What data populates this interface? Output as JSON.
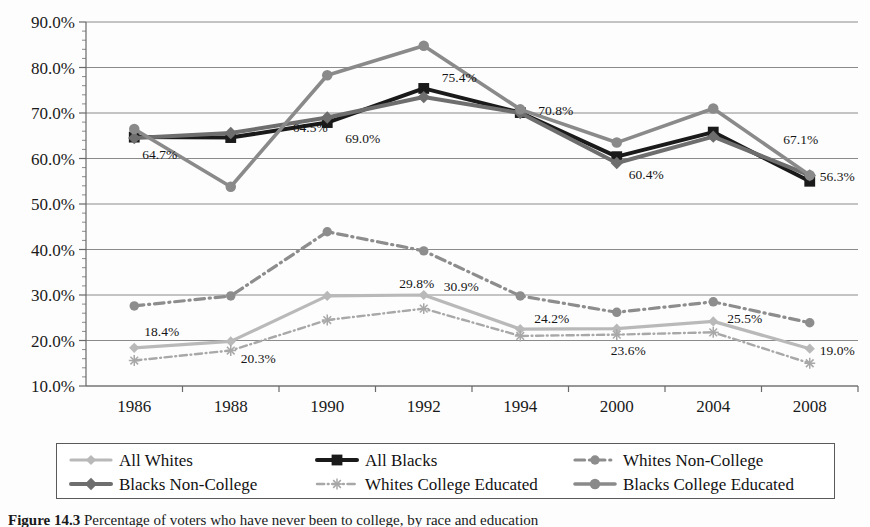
{
  "figure": {
    "caption_label": "Figure 14.3",
    "caption_text": "Percentage of voters who have never been to college, by race and education"
  },
  "legend": {
    "items": [
      {
        "label": "All Whites",
        "color": "#b9b9b9",
        "marker": "diamond",
        "dash": "solid",
        "width": 3.2
      },
      {
        "label": "All Blacks",
        "color": "#1a1a1a",
        "marker": "square",
        "dash": "solid",
        "width": 4.0
      },
      {
        "label": "Whites Non-College",
        "color": "#8d8d8d",
        "marker": "circle",
        "dash": "dashdot",
        "width": 3.2
      },
      {
        "label": "Blacks Non-College",
        "color": "#6e6e6e",
        "marker": "diamond",
        "dash": "solid",
        "width": 4.0
      },
      {
        "label": "Whites College Educated",
        "color": "#a8a8a8",
        "marker": "star",
        "dash": "dashdot",
        "width": 2.4
      },
      {
        "label": "Blacks College Educated",
        "color": "#8a8a8a",
        "marker": "circle",
        "dash": "solid",
        "width": 3.6
      }
    ]
  },
  "chart_data": {
    "type": "line",
    "title": "",
    "xlabel": "",
    "ylabel": "",
    "categories": [
      "1986",
      "1988",
      "1990",
      "1992",
      "1994",
      "2000",
      "2004",
      "2008"
    ],
    "ylim": [
      10,
      90
    ],
    "ytick_labels": [
      "10.0%",
      "20.0%",
      "30.0%",
      "40.0%",
      "50.0%",
      "60.0%",
      "70.0%",
      "80.0%",
      "90.0%"
    ],
    "ytick_values": [
      10,
      20,
      30,
      40,
      50,
      60,
      70,
      80,
      90
    ],
    "minor_tick_step": 2,
    "grid": "horizontal",
    "legend_position": "bottom",
    "series": [
      {
        "name": "All Whites",
        "color": "#b9b9b9",
        "marker": "diamond",
        "dash": "solid",
        "width": 3.2,
        "values": [
          18.4,
          19.8,
          29.8,
          30.0,
          22.5,
          22.6,
          24.2,
          18.2
        ]
      },
      {
        "name": "All Blacks",
        "color": "#1a1a1a",
        "marker": "square",
        "dash": "solid",
        "width": 4.0,
        "values": [
          64.7,
          64.6,
          67.9,
          75.4,
          70.1,
          60.4,
          65.8,
          55.0
        ]
      },
      {
        "name": "Whites Non-College",
        "color": "#8d8d8d",
        "marker": "circle",
        "dash": "dashdot",
        "width": 3.2,
        "values": [
          27.6,
          29.8,
          43.9,
          39.7,
          29.8,
          26.2,
          28.5,
          23.9
        ]
      },
      {
        "name": "Blacks Non-College",
        "color": "#6e6e6e",
        "marker": "diamond",
        "dash": "solid",
        "width": 4.0,
        "values": [
          64.5,
          65.6,
          69.0,
          73.5,
          70.0,
          59.0,
          64.8,
          56.3
        ]
      },
      {
        "name": "Whites College Educated",
        "color": "#a8a8a8",
        "marker": "star",
        "dash": "dashdot",
        "width": 2.4,
        "values": [
          15.6,
          17.8,
          24.5,
          27.0,
          21.0,
          21.3,
          21.8,
          15.0
        ]
      },
      {
        "name": "Blacks College Educated",
        "color": "#8a8a8a",
        "marker": "circle",
        "dash": "solid",
        "width": 3.6,
        "values": [
          66.5,
          53.8,
          78.3,
          84.8,
          70.8,
          63.5,
          71.0,
          56.3
        ]
      }
    ],
    "point_labels": [
      {
        "text": "64.7%",
        "x": 1986,
        "y": 64.7,
        "dx": 8,
        "dy": 22
      },
      {
        "text": "64.5%",
        "x": 1988,
        "y": 64.6,
        "dx": 62,
        "dy": -6
      },
      {
        "text": "69.0%",
        "x": 1990,
        "y": 67.9,
        "dx": 18,
        "dy": 20
      },
      {
        "text": "75.4%",
        "x": 1992,
        "y": 75.4,
        "dx": 18,
        "dy": -6
      },
      {
        "text": "70.8%",
        "x": 1994,
        "y": 70.8,
        "dx": 18,
        "dy": 6
      },
      {
        "text": "60.4%",
        "x": 2000,
        "y": 60.4,
        "dx": 12,
        "dy": 22
      },
      {
        "text": "67.1%",
        "x": 2004,
        "y": 68.0,
        "dx": 70,
        "dy": 22
      },
      {
        "text": "56.3%",
        "x": 2008,
        "y": 56.3,
        "dx": 10,
        "dy": 6
      },
      {
        "text": "18.4%",
        "x": 1986,
        "y": 18.4,
        "dx": 10,
        "dy": -12
      },
      {
        "text": "20.3%",
        "x": 1988,
        "y": 19.8,
        "dx": 10,
        "dy": 22
      },
      {
        "text": "29.8%",
        "x": 1990,
        "y": 29.8,
        "dx": 72,
        "dy": -8
      },
      {
        "text": "30.9%",
        "x": 1992,
        "y": 30.0,
        "dx": 20,
        "dy": -4
      },
      {
        "text": "24.2%",
        "x": 1994,
        "y": 22.5,
        "dx": 14,
        "dy": -6
      },
      {
        "text": "23.6%",
        "x": 2000,
        "y": 22.6,
        "dx": -6,
        "dy": 26
      },
      {
        "text": "25.5%",
        "x": 2004,
        "y": 24.2,
        "dx": 14,
        "dy": 2
      },
      {
        "text": "19.0%",
        "x": 2008,
        "y": 18.2,
        "dx": 10,
        "dy": 6
      }
    ]
  }
}
